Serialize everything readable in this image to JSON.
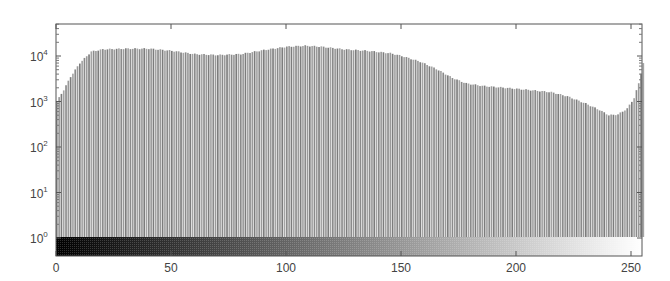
{
  "chart_data": {
    "type": "bar",
    "title": "",
    "xlabel": "",
    "ylabel": "",
    "yscale": "log",
    "xlim": [
      0,
      255
    ],
    "ylim_exponents": [
      -0.5,
      4.7
    ],
    "x_ticks": [
      0,
      50,
      100,
      150,
      200,
      250
    ],
    "y_ticks": [
      {
        "base": "10",
        "exp": "0"
      },
      {
        "base": "10",
        "exp": "1"
      },
      {
        "base": "10",
        "exp": "2"
      },
      {
        "base": "10",
        "exp": "3"
      },
      {
        "base": "10",
        "exp": "4"
      }
    ],
    "grid": false,
    "legend": null,
    "colorbar": {
      "position": "bottom",
      "from": "#000000",
      "to": "#ffffff",
      "range": [
        0,
        255
      ]
    },
    "keypoints": {
      "x": [
        0,
        3,
        6,
        10,
        15,
        20,
        30,
        40,
        50,
        60,
        70,
        80,
        90,
        100,
        108,
        115,
        125,
        135,
        145,
        150,
        158,
        165,
        172,
        178,
        185,
        195,
        205,
        215,
        222,
        230,
        236,
        240,
        244,
        248,
        251,
        253,
        255
      ],
      "values": [
        1000,
        1800,
        3500,
        7000,
        12500,
        14000,
        14500,
        14500,
        13000,
        11000,
        10500,
        11000,
        13500,
        16000,
        16800,
        16000,
        14000,
        13000,
        11500,
        10000,
        7500,
        5200,
        3300,
        2500,
        2200,
        2000,
        1800,
        1600,
        1300,
        900,
        650,
        500,
        520,
        700,
        1200,
        2500,
        7000
      ]
    }
  }
}
